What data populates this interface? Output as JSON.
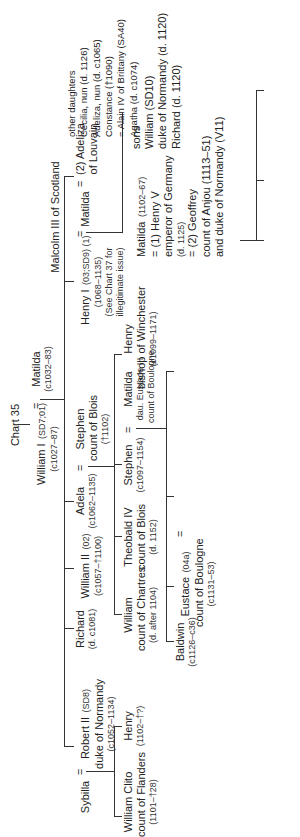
{
  "chart": {
    "title": "Chart 35",
    "root": {
      "william_i": {
        "name": "William I",
        "code": "(SD7;01)",
        "dates": "(c1027–87)"
      },
      "matilda": {
        "name": "Matilda",
        "dates": "(c1032–83)"
      }
    },
    "gen2": {
      "robert_ii": {
        "name": "Robert II",
        "code": "(SD8)",
        "title": "duke of Normandy",
        "dates": "(c1052–1134)",
        "spouse": "Sybilla"
      },
      "richard": {
        "name": "Richard",
        "dates": "(d. c1081)"
      },
      "william_ii": {
        "name": "William II",
        "code": "(02)",
        "dates": "(c1057–†1100)"
      },
      "adela": {
        "name": "Adela",
        "dates": "(c1062–1135)",
        "spouse_name": "Stephen",
        "spouse_title": "count of Blois",
        "spouse_dates": "(†1102)"
      },
      "henry_i": {
        "name": "Henry I",
        "code": "(03;SD9) (1)",
        "dates": "(1068–1135)",
        "note1": "(See Chart 37 for",
        "note2": "illegitimate issue)"
      },
      "henry_i_spouse1": {
        "name": "Matilda",
        "parent": "Malcolm III of Scotland"
      },
      "henry_i_spouse2": {
        "name": "(2) Adeliza",
        "title": "of Louvain"
      },
      "other_daughters": {
        "heading": "other daughters",
        "items": [
          "Cecilia, nun (d. 1126)",
          "Adeliza, nun (d. c1065)",
          "Constance (†1090)",
          "= Alain IV of Brittany (SA40)",
          "Agatha (d. c1074)"
        ]
      }
    },
    "gen3": {
      "william_clito": {
        "name": "William Clito",
        "title": "count of Flanders",
        "dates": "(1101–†28)"
      },
      "henry_robert": {
        "name": "Henry",
        "dates": "(1102–†?)"
      },
      "william_chartres": {
        "name": "William",
        "title": "count of Chartres",
        "dates": "(d. after 1104)"
      },
      "theobald_iv": {
        "name": "Theobald IV",
        "title": "count of Blois",
        "dates": "(d. 1152)"
      },
      "stephen": {
        "name": "Stephen",
        "dates": "(c1097–1154)",
        "spouse_name": "Matilda",
        "spouse_title1": "dau. Eustace III",
        "spouse_title2": "count of Boulogne"
      },
      "henry_winchester": {
        "name": "Henry",
        "title": "bishop of Winchester",
        "dates": "(c1099–1171)"
      },
      "matilda_empress": {
        "name": "Matilda",
        "dates": "(1102–67)",
        "m1": "= (1) Henry V",
        "m1_title": "emperor of Germany",
        "m1_dates": "(d. 1125)",
        "m2": "= (2) Geoffrey",
        "m2_title": "count of Anjou (1113–51)",
        "m2_title2": "and duke of Normandy (V11)"
      },
      "sons": {
        "heading": "sons",
        "william": "William (SD10)",
        "william_title": "duke of Normandy (d. 1120)",
        "richard": "Richard (d. 1120)"
      }
    },
    "gen4": {
      "baldwin": {
        "name": "Baldwin",
        "dates": "(c1126–c36)"
      },
      "eustace": {
        "name": "Eustace",
        "code": "(04a)",
        "title": "count of Boulogne",
        "dates": "(c1131–53)",
        "spouse_name": "Constance",
        "spouse_title": "dau. Louis VI"
      },
      "william_boulogne": {
        "name": "William",
        "title1": "count of",
        "title2": "Boulogne",
        "dates": "(†1159)"
      },
      "isabella": {
        "name": "Isabella",
        "title": "de Warenne",
        "dates": "(d. 1199?)"
      },
      "hamelin": {
        "name": "Hamelin",
        "title": "of Anjou",
        "dates": "(d. 1202)"
      },
      "warenne": "Warenne family",
      "mary": {
        "name": "Mary",
        "title1": "countess of",
        "title2": "Boulogne",
        "dates": "(d. 1182)"
      },
      "matthew": {
        "name": "Matthew I",
        "title1": "count of",
        "title2": "Flanders",
        "dates": "(d. 1173)"
      },
      "two_children": "2 children",
      "henry_ii": {
        "name": "Henry II",
        "ref": "See Chart 38"
      },
      "geoffrey_nantes": {
        "name": "Geoffrey",
        "title": "count of Nantes",
        "dates": "(d. 1158)"
      },
      "william_poitou": {
        "name": "William",
        "title": "count of Poitou",
        "dates": "(d. 1164)"
      }
    },
    "symbols": {
      "eq": "="
    }
  }
}
